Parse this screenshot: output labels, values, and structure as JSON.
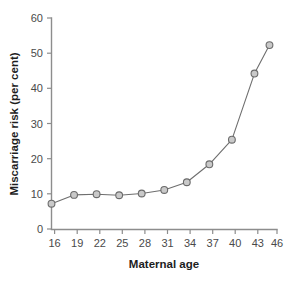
{
  "chart_data": {
    "type": "line",
    "title": "",
    "xlabel": "Maternal age",
    "ylabel": "Miscarriage risk (per cent)",
    "x": [
      16,
      19,
      22,
      25,
      28,
      31,
      34,
      37,
      40,
      43,
      45
    ],
    "values": [
      7.2,
      9.7,
      9.9,
      9.6,
      10.1,
      11.1,
      13.3,
      18.4,
      25.4,
      44.2,
      52.3
    ],
    "series": [
      {
        "name": "Miscarriage risk",
        "values": [
          7.2,
          9.7,
          9.9,
          9.6,
          10.1,
          11.1,
          13.3,
          18.4,
          25.4,
          44.2,
          52.3
        ]
      }
    ],
    "xlim": [
      16,
      46
    ],
    "ylim": [
      0,
      60
    ],
    "xticks": [
      16,
      19,
      22,
      25,
      28,
      31,
      34,
      37,
      40,
      43,
      46
    ],
    "yticks": [
      0,
      10,
      20,
      30,
      40,
      50,
      60
    ],
    "xtick_labels": [
      "16",
      "19",
      "22",
      "25",
      "28",
      "31",
      "34",
      "37",
      "40",
      "43",
      "46"
    ],
    "ytick_labels": [
      "0",
      "10",
      "20",
      "30",
      "40",
      "50",
      "60"
    ],
    "grid": false,
    "legend": null,
    "marker": "circle",
    "colors": {
      "line": "#6e6e6e",
      "marker_fill": "#c9c9c9",
      "marker_edge": "#6b6b6b",
      "axis": "#8d8d8d",
      "text": "#1d1d1d",
      "background": "#ffffff"
    }
  }
}
